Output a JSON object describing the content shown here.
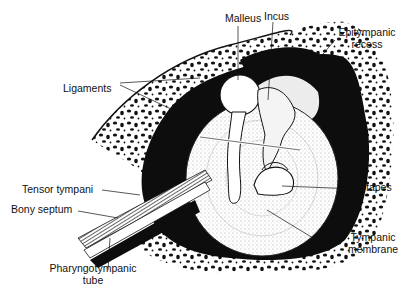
{
  "diagram": {
    "labels": [
      {
        "id": "malleus",
        "text": "Malleus"
      },
      {
        "id": "incus",
        "text": "Incus"
      },
      {
        "id": "epitympanic",
        "line1": "Epitympanic",
        "line2": "recess"
      },
      {
        "id": "ligaments",
        "text": "Ligaments"
      },
      {
        "id": "tensor",
        "text": "Tensor tympani"
      },
      {
        "id": "bony",
        "text": "Bony septum"
      },
      {
        "id": "stapes",
        "text": "Stapes"
      },
      {
        "id": "tympanic",
        "line1": "Tympanic",
        "line2": "membrane"
      },
      {
        "id": "pharyngo",
        "line1": "Pharyngotympanic",
        "line2": "tube"
      }
    ],
    "colors": {
      "ink": "#111111",
      "paper": "#ffffff"
    }
  }
}
